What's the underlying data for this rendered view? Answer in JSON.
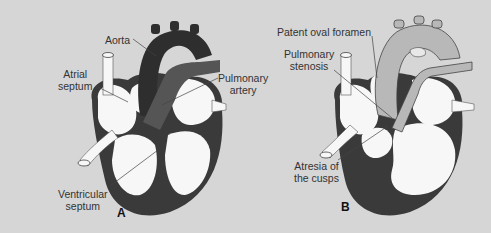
{
  "colors": {
    "background": "#d6d6d6",
    "myocardium_dark": "#3a3a3a",
    "aorta_dark": "#2e2e2e",
    "pulmonary_artery_mid": "#555555",
    "chamber_light": "#f7f7f7",
    "vessel_light_b": "#b8b8b8",
    "label_text": "#333333"
  },
  "panels": [
    {
      "id": "A",
      "letter": "A",
      "labels": {
        "aorta": "Aorta",
        "atrial_septum_line1": "Atrial",
        "atrial_septum_line2": "septum",
        "pulmonary_artery_line1": "Pulmonary",
        "pulmonary_artery_line2": "artery",
        "ventricular_septum_line1": "Ventricular",
        "ventricular_septum_line2": "septum"
      }
    },
    {
      "id": "B",
      "letter": "B",
      "labels": {
        "patent_oval_foramen": "Patent oval foramen",
        "pulmonary_stenosis_line1": "Pulmonary",
        "pulmonary_stenosis_line2": "stenosis",
        "atresia_line1": "Atresia of",
        "atresia_line2": "the cusps"
      }
    }
  ]
}
